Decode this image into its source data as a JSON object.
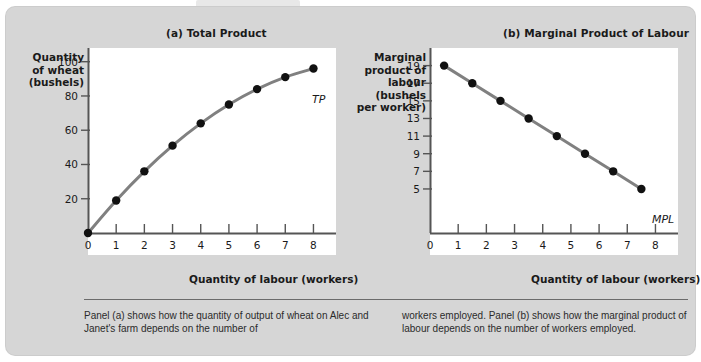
{
  "figure": {
    "panels": [
      {
        "key": "a",
        "title": "(a) Total Product",
        "y_axis_title": "Quantity\nof wheat\n(bushels)",
        "x_axis_title": "Quantity of labour (workers)",
        "series_label": "TP"
      },
      {
        "key": "b",
        "title": "(b) Marginal Product of Labour",
        "y_axis_title": "Marginal\nproduct of\nlabour (bushels\nper worker)",
        "x_axis_title": "Quantity of labour (workers)",
        "series_label": "MPL"
      }
    ],
    "caption_left": "Panel (a) shows how the quantity of output of wheat on Alec and Janet's farm depends on the number of",
    "caption_right": "workers employed. Panel (b) shows how the marginal product of labour depends on the number of workers employed.",
    "colors": {
      "card_background": "#d6d6d6",
      "plot_background": "#ffffff",
      "curve": "#808080",
      "marker": "#111111",
      "axis": "#555555",
      "text": "#1a1a1a"
    }
  },
  "chart_data": [
    {
      "type": "line",
      "title": "(a) Total Product",
      "xlabel": "Quantity of labour (workers)",
      "ylabel": "Quantity of wheat (bushels)",
      "series_name": "TP",
      "x": [
        0,
        1,
        2,
        3,
        4,
        5,
        6,
        7,
        8
      ],
      "values": [
        0,
        19,
        36,
        51,
        64,
        75,
        84,
        91,
        96
      ],
      "xlim": [
        0,
        8.8
      ],
      "ylim": [
        0,
        108
      ],
      "xticks": [
        0,
        1,
        2,
        3,
        4,
        5,
        6,
        7,
        8
      ],
      "xticklabels": [
        "0",
        "1",
        "2",
        "3",
        "4",
        "5",
        "6",
        "7",
        "8"
      ],
      "yticks": [
        20,
        40,
        60,
        80,
        100
      ],
      "yticklabels": [
        "20",
        "40",
        "60",
        "80",
        "100"
      ],
      "grid": false,
      "legend": "none",
      "markers": true
    },
    {
      "type": "line",
      "title": "(b) Marginal Product of Labour",
      "xlabel": "Quantity of labour (workers)",
      "ylabel": "Marginal product of labour (bushels per worker)",
      "series_name": "MPL",
      "x": [
        0.5,
        1.5,
        2.5,
        3.5,
        4.5,
        5.5,
        6.5,
        7.5
      ],
      "values": [
        19,
        17,
        15,
        13,
        11,
        9,
        7,
        5
      ],
      "xlim": [
        0,
        8.8
      ],
      "ylim": [
        0,
        21
      ],
      "xticks": [
        0,
        1,
        2,
        3,
        4,
        5,
        6,
        7,
        8
      ],
      "xticklabels": [
        "0",
        "1",
        "2",
        "3",
        "4",
        "5",
        "6",
        "7",
        "8"
      ],
      "yticks": [
        5,
        7,
        9,
        11,
        13,
        15,
        17,
        19
      ],
      "yticklabels": [
        "5",
        "7",
        "9",
        "11",
        "13",
        "15",
        "17",
        "19"
      ],
      "grid": false,
      "legend": "none",
      "markers": true
    }
  ]
}
